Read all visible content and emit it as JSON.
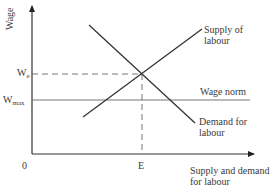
{
  "diagram": {
    "type": "labour-market supply-demand",
    "axes": {
      "y_label": "Wage",
      "x_label_line1": "Supply and demand",
      "x_label_line2": "for labour",
      "origin_label": "0"
    },
    "levels": {
      "we_base": "W",
      "we_sub": "e",
      "wmax_base": "W",
      "wmax_sub": "max",
      "e_label": "E"
    },
    "curves": {
      "supply_line1": "Supply of",
      "supply_line2": "labour",
      "demand_line1": "Demand for",
      "demand_line2": "labour",
      "wage_norm": "Wage norm"
    },
    "colors": {
      "line": "#333333",
      "guide": "#555555"
    }
  }
}
